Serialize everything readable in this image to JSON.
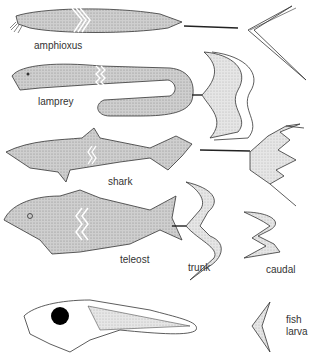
{
  "labels": {
    "amphioxus": "amphioxus",
    "lamprey": "lamprey",
    "shark": "shark",
    "teleost": "teleost",
    "trunk": "trunk",
    "caudal": "caudal",
    "fish": "fish",
    "larva": "larva"
  },
  "colors": {
    "stipple": "#bdbdbd",
    "stipple_light": "#dedede",
    "stroke": "#333333",
    "eye": "#000000"
  }
}
